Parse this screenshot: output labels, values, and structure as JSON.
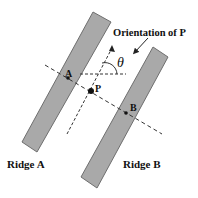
{
  "labels": {
    "orientation": "Orientation of P",
    "theta": "θ",
    "point_a": "A",
    "point_b": "B",
    "point_p": "P",
    "ridge_a": "Ridge A",
    "ridge_b": "Ridge B"
  },
  "colors": {
    "ridge_fill": "#a9a9a9",
    "ridge_stroke": "#6e6e6e",
    "line": "#333333",
    "text": "#111111"
  }
}
